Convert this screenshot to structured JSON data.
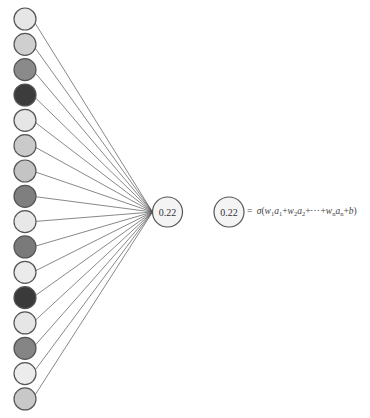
{
  "diagram": {
    "input_layer": {
      "count": 16,
      "cx": 25,
      "cy_start": 19,
      "spacing": 25.33,
      "radius": 11,
      "stroke": "#555555",
      "fills": [
        "#e6e6e6",
        "#cfcfcf",
        "#8a8a8a",
        "#3c3c3c",
        "#e6e6e6",
        "#cacaca",
        "#c4c4c4",
        "#7f7f7f",
        "#e8e8e8",
        "#7a7a7a",
        "#ebebeb",
        "#3a3a3a",
        "#e6e6e6",
        "#858585",
        "#ececec",
        "#c8c8c8"
      ]
    },
    "output_node": {
      "label": "0.22",
      "cx": 167.5,
      "cy": 212,
      "radius": 15,
      "fill": "#f4f4f4",
      "stroke": "#555555"
    },
    "equation_node": {
      "label": "0.22",
      "cx": 229,
      "cy": 212,
      "radius": 15,
      "fill": "#f4f4f4",
      "stroke": "#555555"
    },
    "edge_color": "#555555",
    "formula": {
      "equals": "=",
      "sigma": "σ",
      "open": "(",
      "w1": "w",
      "s1": "1",
      "a1": "a",
      "s1b": "1",
      "plus1": "+",
      "w2": "w",
      "s2": "2",
      "a2": "a",
      "s2b": "2",
      "plus2": "+⋯+",
      "wn": "w",
      "sn": "n",
      "an": "a",
      "snb": "n",
      "plus3": "+",
      "b": "b",
      "close": ")"
    }
  }
}
